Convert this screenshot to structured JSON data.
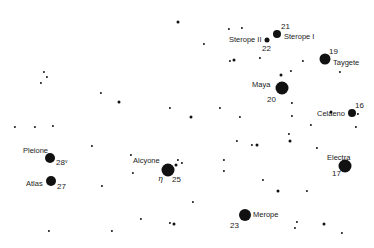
{
  "chart": {
    "background": "#ffffff",
    "star_color": "#111111"
  },
  "named_stars": [
    {
      "name": "Sterope II",
      "number": "22",
      "x": 267,
      "y": 40,
      "r": 2.5
    },
    {
      "name": "Sterope I",
      "number": "21",
      "x": 277,
      "y": 34,
      "r": 4
    },
    {
      "name": "Taygete",
      "number": "19",
      "x": 325,
      "y": 59,
      "r": 5.5
    },
    {
      "name": "Maya",
      "number": "20",
      "x": 282,
      "y": 88,
      "r": 6.5
    },
    {
      "name": "Celaeno",
      "number": "16",
      "x": 352,
      "y": 113,
      "r": 4
    },
    {
      "name": "Pleione",
      "number": "28",
      "suffix": "v",
      "x": 50,
      "y": 158,
      "r": 5
    },
    {
      "name": "Atlas",
      "number": "27",
      "x": 51,
      "y": 181,
      "r": 5
    },
    {
      "name": "Alcyone",
      "number": "25",
      "greek": "η",
      "x": 168,
      "y": 170,
      "r": 6.5
    },
    {
      "name": "Electra",
      "number": "17",
      "x": 345,
      "y": 166,
      "r": 6.5
    },
    {
      "name": "Merope",
      "number": "23",
      "x": 245,
      "y": 215,
      "r": 6
    }
  ],
  "labels": {
    "sterope2": "Sterope II",
    "sterope2_num": "22",
    "sterope1": "Sterope I",
    "sterope1_num": "21",
    "taygete": "Taygete",
    "taygete_num": "19",
    "maya": "Maya",
    "maya_num": "20",
    "celaeno": "Celaeno",
    "celaeno_num": "16",
    "pleione": "Pleione",
    "pleione_num": "28",
    "pleione_var": "v",
    "atlas": "Atlas",
    "atlas_num": "27",
    "alcyone": "Alcyone",
    "alcyone_greek": "η",
    "alcyone_num": "25",
    "electra": "Electra",
    "electra_num": "17",
    "merope": "Merope",
    "merope_num": "23"
  },
  "field_stars": [
    [
      178,
      22
    ],
    [
      204,
      44
    ],
    [
      229,
      29
    ],
    [
      242,
      28
    ],
    [
      230,
      61
    ],
    [
      234,
      60
    ],
    [
      44,
      72
    ],
    [
      47,
      77
    ],
    [
      41,
      83
    ],
    [
      101,
      93
    ],
    [
      119,
      102
    ],
    [
      15,
      127
    ],
    [
      35,
      127
    ],
    [
      53,
      126
    ],
    [
      170,
      108
    ],
    [
      191,
      117
    ],
    [
      220,
      108
    ],
    [
      240,
      117
    ],
    [
      260,
      58
    ],
    [
      291,
      71
    ],
    [
      281,
      75
    ],
    [
      303,
      61
    ],
    [
      340,
      72
    ],
    [
      292,
      103
    ],
    [
      292,
      116
    ],
    [
      331,
      112
    ],
    [
      358,
      114
    ],
    [
      311,
      125
    ],
    [
      356,
      127
    ],
    [
      237,
      141
    ],
    [
      290,
      141
    ],
    [
      92,
      146
    ],
    [
      131,
      155
    ],
    [
      133,
      173
    ],
    [
      178,
      160
    ],
    [
      176,
      165
    ],
    [
      182,
      163
    ],
    [
      224,
      160
    ],
    [
      224,
      171
    ],
    [
      252,
      145
    ],
    [
      257,
      145
    ],
    [
      289,
      134
    ],
    [
      317,
      148
    ],
    [
      102,
      186
    ],
    [
      263,
      180
    ],
    [
      278,
      191
    ],
    [
      307,
      191
    ],
    [
      193,
      202
    ],
    [
      141,
      219
    ],
    [
      170,
      223
    ],
    [
      174,
      224
    ],
    [
      49,
      231
    ],
    [
      112,
      231
    ],
    [
      297,
      222
    ],
    [
      295,
      228
    ],
    [
      324,
      224
    ],
    [
      342,
      233
    ]
  ]
}
